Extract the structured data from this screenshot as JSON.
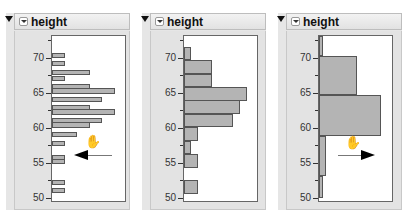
{
  "panels": [
    {
      "title": "height",
      "arrow_direction": "left",
      "bin_width": 1,
      "bars": [
        {
          "y": 53,
          "h": 5,
          "w": 13
        },
        {
          "y": 61,
          "h": 5,
          "w": 13
        },
        {
          "y": 70,
          "h": 5,
          "w": 38
        },
        {
          "y": 76,
          "h": 5,
          "w": 13
        },
        {
          "y": 84,
          "h": 5,
          "w": 38
        },
        {
          "y": 88,
          "h": 6,
          "w": 63
        },
        {
          "y": 97,
          "h": 5,
          "w": 50
        },
        {
          "y": 105,
          "h": 5,
          "w": 38
        },
        {
          "y": 109,
          "h": 6,
          "w": 63
        },
        {
          "y": 118,
          "h": 5,
          "w": 50
        },
        {
          "y": 122,
          "h": 6,
          "w": 38
        },
        {
          "y": 132,
          "h": 5,
          "w": 25
        },
        {
          "y": 141,
          "h": 5,
          "w": 13
        },
        {
          "y": 155,
          "h": 5,
          "w": 13
        },
        {
          "y": 159,
          "h": 5,
          "w": 13
        },
        {
          "y": 180,
          "h": 5,
          "w": 13
        },
        {
          "y": 188,
          "h": 5,
          "w": 13
        }
      ]
    },
    {
      "title": "height",
      "arrow_direction": "none",
      "bin_width": 2,
      "bars": [
        {
          "y": 47,
          "h": 13,
          "w": 7
        },
        {
          "y": 60,
          "h": 14,
          "w": 28
        },
        {
          "y": 74,
          "h": 13,
          "w": 28
        },
        {
          "y": 87,
          "h": 14,
          "w": 63
        },
        {
          "y": 100,
          "h": 14,
          "w": 56
        },
        {
          "y": 114,
          "h": 13,
          "w": 49
        },
        {
          "y": 127,
          "h": 14,
          "w": 14
        },
        {
          "y": 141,
          "h": 13,
          "w": 7
        },
        {
          "y": 154,
          "h": 14,
          "w": 14
        },
        {
          "y": 180,
          "h": 14,
          "w": 14
        }
      ]
    },
    {
      "title": "height",
      "arrow_direction": "right",
      "bin_width": 6,
      "bars": [
        {
          "y": 36,
          "h": 20,
          "w": 4
        },
        {
          "y": 56,
          "h": 39,
          "w": 38
        },
        {
          "y": 95,
          "h": 41,
          "w": 62
        },
        {
          "y": 136,
          "h": 40,
          "w": 7
        },
        {
          "y": 176,
          "h": 22,
          "w": 4
        }
      ]
    }
  ],
  "axis": {
    "ticks": [
      {
        "value": "70",
        "y": 58
      },
      {
        "value": "65",
        "y": 93
      },
      {
        "value": "60",
        "y": 128
      },
      {
        "value": "55",
        "y": 163
      },
      {
        "value": "50",
        "y": 198
      }
    ],
    "minor_ticks_y": [
      40,
      75,
      110,
      145,
      180
    ]
  },
  "icons": {
    "disclosure": "triangle-down-icon",
    "menu": "red-triangle-menu-icon",
    "hand": "grabber-hand-icon",
    "arrow": "drag-direction-arrow-icon"
  },
  "colors": {
    "bar_fill": "#b4b4b4",
    "bar_border": "#555555",
    "panel_bg": "#e6e6e6",
    "plot_bg": "#ffffff"
  }
}
